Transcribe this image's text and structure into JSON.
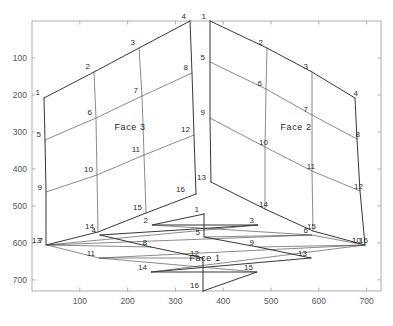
{
  "figure": {
    "title": "",
    "background_color": "#ffffff",
    "axis_color": "#9a9a9a",
    "mesh_color": "#3b3b3b",
    "label_color": "#2a2a2a"
  },
  "chart_data": {
    "type": "line",
    "title": "",
    "xlabel": "",
    "ylabel": "",
    "xlim": [
      0,
      730
    ],
    "ylim": [
      730,
      0
    ],
    "grid": false,
    "legend": "none",
    "xticks": [
      100,
      200,
      300,
      400,
      500,
      600,
      700
    ],
    "xtick_labels": [
      "100",
      "200",
      "300",
      "400",
      "500",
      "600",
      "700"
    ],
    "yticks": [
      100,
      200,
      300,
      400,
      500,
      600,
      700
    ],
    "ytick_labels": [
      "100",
      "200",
      "300",
      "400",
      "500",
      "600",
      "700"
    ],
    "faces": [
      {
        "name": "Face 3",
        "label": "Face 3",
        "label_pos": [
          130,
          130
        ],
        "corners": [
          [
            44,
            98
          ],
          [
            190,
            21
          ],
          [
            247,
            272
          ],
          [
            46,
            245
          ]
        ],
        "node_count": 16,
        "nodes": [
          {
            "id": 1,
            "x": 44,
            "y": 98,
            "lx": 40,
            "ly": 95
          },
          {
            "id": 2,
            "x": 94,
            "y": 72,
            "lx": 90,
            "ly": 69
          },
          {
            "id": 3,
            "x": 139,
            "y": 48,
            "lx": 135,
            "ly": 45
          },
          {
            "id": 4,
            "x": 190,
            "y": 21,
            "lx": 186,
            "ly": 19
          },
          {
            "id": 5,
            "x": 45,
            "y": 140,
            "lx": 41,
            "ly": 137
          },
          {
            "id": 6,
            "x": 96,
            "y": 118,
            "lx": 92,
            "ly": 115
          },
          {
            "id": 7,
            "x": 142,
            "y": 96,
            "lx": 138,
            "ly": 93
          },
          {
            "id": 8,
            "x": 192,
            "y": 73,
            "lx": 188,
            "ly": 70
          },
          {
            "id": 9,
            "x": 46,
            "y": 192,
            "lx": 42,
            "ly": 190
          },
          {
            "id": 10,
            "x": 97,
            "y": 175,
            "lx": 93,
            "ly": 172
          },
          {
            "id": 11,
            "x": 144,
            "y": 155,
            "lx": 140,
            "ly": 152
          },
          {
            "id": 12,
            "x": 194,
            "y": 135,
            "lx": 190,
            "ly": 132
          },
          {
            "id": 13,
            "x": 46,
            "y": 245,
            "lx": 41,
            "ly": 243
          },
          {
            "id": 14,
            "x": 98,
            "y": 232,
            "lx": 94,
            "ly": 229
          },
          {
            "id": 15,
            "x": 146,
            "y": 213,
            "lx": 142,
            "ly": 210
          },
          {
            "id": 16,
            "x": 196,
            "y": 194,
            "lx": 185,
            "ly": 192
          }
        ]
      },
      {
        "name": "Face 2",
        "label": "Face 2",
        "label_pos": [
          296,
          130
        ],
        "corners": [
          [
            210,
            21
          ],
          [
            355,
            98
          ],
          [
            365,
            245
          ],
          [
            211,
            272
          ]
        ],
        "node_count": 16,
        "nodes": [
          {
            "id": 1,
            "x": 210,
            "y": 21,
            "lx": 206,
            "ly": 19
          },
          {
            "id": 2,
            "x": 267,
            "y": 48,
            "lx": 263,
            "ly": 45
          },
          {
            "id": 3,
            "x": 312,
            "y": 72,
            "lx": 308,
            "ly": 69
          },
          {
            "id": 4,
            "x": 355,
            "y": 98,
            "lx": 358,
            "ly": 96
          },
          {
            "id": 5,
            "x": 210,
            "y": 62,
            "lx": 205,
            "ly": 60
          },
          {
            "id": 6,
            "x": 266,
            "y": 89,
            "lx": 262,
            "ly": 86
          },
          {
            "id": 7,
            "x": 312,
            "y": 115,
            "lx": 308,
            "ly": 112
          },
          {
            "id": 8,
            "x": 357,
            "y": 139,
            "lx": 360,
            "ly": 137
          },
          {
            "id": 9,
            "x": 210,
            "y": 118,
            "lx": 205,
            "ly": 115
          },
          {
            "id": 10,
            "x": 265,
            "y": 147,
            "lx": 268,
            "ly": 145
          },
          {
            "id": 11,
            "x": 312,
            "y": 171,
            "lx": 315,
            "ly": 169
          },
          {
            "id": 12,
            "x": 360,
            "y": 191,
            "lx": 363,
            "ly": 189
          },
          {
            "id": 13,
            "x": 211,
            "y": 182,
            "lx": 206,
            "ly": 180
          },
          {
            "id": 14,
            "x": 265,
            "y": 209,
            "lx": 268,
            "ly": 207
          },
          {
            "id": 15,
            "x": 313,
            "y": 231,
            "lx": 316,
            "ly": 229
          },
          {
            "id": 16,
            "x": 365,
            "y": 245,
            "lx": 368,
            "ly": 243
          }
        ]
      },
      {
        "name": "Face 1",
        "label": "Face 1",
        "label_pos": [
          205,
          261
        ],
        "corners": [
          [
            204,
            214
          ],
          [
            365,
            245
          ],
          [
            203,
            291
          ],
          [
            47,
            245
          ]
        ],
        "node_count": 16,
        "nodes": [
          {
            "id": 1,
            "x": 204,
            "y": 214,
            "lx": 199,
            "ly": 212
          },
          {
            "id": 2,
            "x": 152,
            "y": 225,
            "lx": 148,
            "ly": 223
          },
          {
            "id": 3,
            "x": 258,
            "y": 225,
            "lx": 254,
            "ly": 223
          },
          {
            "id": 4,
            "x": 100,
            "y": 235,
            "lx": 96,
            "ly": 233
          },
          {
            "id": 5,
            "x": 204,
            "y": 237,
            "lx": 200,
            "ly": 235
          },
          {
            "id": 6,
            "x": 312,
            "y": 235,
            "lx": 308,
            "ly": 233
          },
          {
            "id": 7,
            "x": 47,
            "y": 245,
            "lx": 43,
            "ly": 243
          },
          {
            "id": 8,
            "x": 151,
            "y": 247,
            "lx": 147,
            "ly": 245
          },
          {
            "id": 9,
            "x": 258,
            "y": 247,
            "lx": 254,
            "ly": 245
          },
          {
            "id": 10,
            "x": 365,
            "y": 245,
            "lx": 361,
            "ly": 243
          },
          {
            "id": 11,
            "x": 99,
            "y": 258,
            "lx": 95,
            "ly": 256
          },
          {
            "id": 12,
            "x": 203,
            "y": 258,
            "lx": 199,
            "ly": 256
          },
          {
            "id": 13,
            "x": 311,
            "y": 258,
            "lx": 307,
            "ly": 256
          },
          {
            "id": 14,
            "x": 151,
            "y": 272,
            "lx": 147,
            "ly": 270
          },
          {
            "id": 15,
            "x": 257,
            "y": 272,
            "lx": 253,
            "ly": 270
          },
          {
            "id": 16,
            "x": 203,
            "y": 291,
            "lx": 199,
            "ly": 288
          }
        ]
      }
    ]
  }
}
